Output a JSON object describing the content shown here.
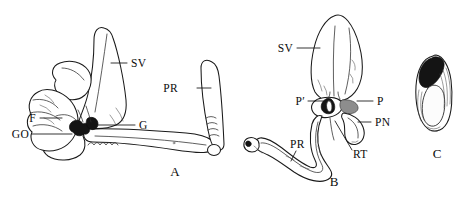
{
  "figure": {
    "background_color": "#ffffff",
    "ink_color": "#111111",
    "width": 474,
    "height": 203,
    "style": "scientific line drawing, stippled shading"
  },
  "panels": [
    {
      "id": "panel-a",
      "letter": "A",
      "letter_x": 175,
      "letter_y": 176,
      "labels": [
        {
          "key": "sv",
          "text": "SV",
          "x": 131,
          "y": 67,
          "anchor": "start",
          "leader": "M 111 63 L 127 63"
        },
        {
          "key": "pr",
          "text": "PR",
          "x": 178,
          "y": 92,
          "anchor": "start",
          "leader": "M 197 88 L 211 88"
        },
        {
          "key": "f",
          "text": "F",
          "x": 31,
          "y": 122,
          "anchor": "start",
          "leader": "M 40 118 L 62 118"
        },
        {
          "key": "go",
          "text": "GO",
          "x": 10,
          "y": 138,
          "anchor": "start",
          "leader": "M 32 134 L 72 134"
        },
        {
          "key": "g",
          "text": "G",
          "x": 139,
          "y": 129,
          "anchor": "start",
          "leader": "M 98 125 L 135 125"
        }
      ]
    },
    {
      "id": "panel-b",
      "letter": "B",
      "letter_x": 334,
      "letter_y": 186,
      "labels": [
        {
          "key": "sv",
          "text": "SV",
          "x": 293,
          "y": 52,
          "anchor": "end",
          "leader": "M 297 48 L 320 48"
        },
        {
          "key": "pp",
          "text": "P′",
          "x": 305,
          "y": 105,
          "anchor": "end",
          "leader": "M 308 101 L 325 101"
        },
        {
          "key": "p",
          "text": "P",
          "x": 377,
          "y": 105,
          "anchor": "start",
          "leader": "M 357 101 L 373 101"
        },
        {
          "key": "pn",
          "text": "PN",
          "x": 375,
          "y": 126,
          "anchor": "start",
          "leader": "M 358 122 L 371 122"
        },
        {
          "key": "rt",
          "text": "RT",
          "x": 355,
          "y": 158,
          "anchor": "start",
          "leader": "M 352 152 L 336 122"
        },
        {
          "key": "pr",
          "text": "PR",
          "x": 290,
          "y": 148,
          "anchor": "start",
          "leader": "M 296 151 L 290 160"
        }
      ]
    },
    {
      "id": "panel-c",
      "letter": "C",
      "letter_x": 437,
      "letter_y": 158,
      "labels": []
    }
  ],
  "legend_keys": {
    "SV": "seminal vesicle",
    "PR": "prostate",
    "F": "flagellum",
    "GO": "gonopore",
    "G": "gland",
    "P": "penis",
    "P'": "penis accessory",
    "PN": "penial nerve",
    "RT": "retractor"
  }
}
